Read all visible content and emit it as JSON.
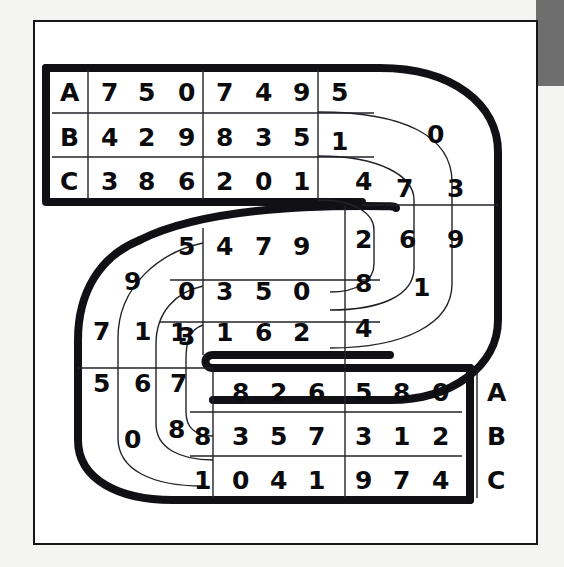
{
  "figure": {
    "kind": "s-shaped-track-diagram",
    "row_labels": [
      "A",
      "B",
      "C"
    ],
    "colors": {
      "ink": "#111115",
      "paper": "#ffffff",
      "page": "#f4f4f2",
      "corner_tab": "#6e6e6e"
    }
  },
  "corner_tab": {
    "label": ""
  },
  "top_band": {
    "name": "top-straight-band",
    "rows": [
      {
        "label": "A",
        "cells": [
          "7",
          "5",
          "0",
          "7",
          "4",
          "9",
          "5"
        ]
      },
      {
        "label": "B",
        "cells": [
          "4",
          "2",
          "9",
          "8",
          "3",
          "5",
          "1"
        ]
      },
      {
        "label": "C",
        "cells": [
          "3",
          "8",
          "6",
          "2",
          "0",
          "1"
        ]
      }
    ]
  },
  "right_curve": {
    "name": "right-u-turn",
    "outer_ring": [
      "3",
      "9",
      "1"
    ],
    "middle_ring": [
      "0",
      "7",
      "6"
    ],
    "inner_ring": [
      "4",
      "2",
      "8",
      "4"
    ]
  },
  "middle_band": {
    "name": "middle-straight-band",
    "rows": [
      {
        "cells": [
          "5",
          "4",
          "7",
          "9"
        ]
      },
      {
        "cells": [
          "0",
          "3",
          "5",
          "0"
        ]
      },
      {
        "cells": [
          "3",
          "1",
          "6",
          "2"
        ]
      }
    ]
  },
  "left_curve": {
    "name": "left-u-turn",
    "outer_ring": [
      "9",
      "7",
      "5",
      "0"
    ],
    "middle_ring": [
      "1",
      "6",
      "8"
    ],
    "inner_ring": [
      "7",
      "1"
    ]
  },
  "bottom_band": {
    "name": "bottom-straight-band",
    "rows": [
      {
        "cells": [
          "8",
          "2",
          "6",
          "5",
          "8",
          "0"
        ],
        "label": "A"
      },
      {
        "cells": [
          "8",
          "3",
          "5",
          "7",
          "3",
          "1",
          "2"
        ],
        "label": "B"
      },
      {
        "cells": [
          "1",
          "0",
          "4",
          "1",
          "9",
          "7",
          "4"
        ],
        "label": "C"
      }
    ]
  },
  "track": {
    "upper_tail_cap": "rounded",
    "lower_tail_cap": "rounded"
  }
}
